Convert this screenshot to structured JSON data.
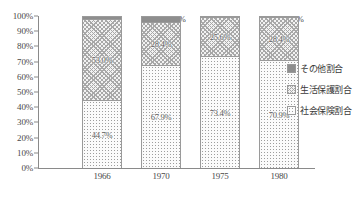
{
  "chart_data": {
    "type": "bar",
    "stacked": true,
    "normalized_percent": true,
    "title": "",
    "subtitle": "",
    "xlabel": "",
    "ylabel": "",
    "categories": [
      "1966",
      "1970",
      "1975",
      "1980"
    ],
    "ylim": [
      0,
      100
    ],
    "ytick_labels": [
      "100%",
      "90%",
      "80%",
      "70%",
      "60%",
      "50%",
      "40%",
      "30%",
      "20%",
      "10%",
      "0%"
    ],
    "ytick_values": [
      100,
      90,
      80,
      70,
      60,
      50,
      40,
      30,
      20,
      10,
      0
    ],
    "grid": false,
    "legend_position": "right",
    "series": [
      {
        "name": "その他割合",
        "key": "other",
        "pattern": "solid-gray",
        "color": "#8e8e8e",
        "values": [
          2.3,
          3.8,
          0.9,
          0.7
        ],
        "labels": [
          "2.3%",
          "3.8%",
          "0.9%",
          "0.7%"
        ],
        "label_placement": "outside-right"
      },
      {
        "name": "生活保護割合",
        "key": "welfare",
        "pattern": "crosshatch",
        "color": "#f2f2f2",
        "values": [
          53.0,
          28.4,
          25.6,
          28.4
        ],
        "labels": [
          "53.0%",
          "28.4%",
          "25.6%",
          "28.4%"
        ],
        "label_placement": "inside-center"
      },
      {
        "name": "社会保険割合",
        "key": "insurance",
        "pattern": "dotted",
        "color": "#fbfbfb",
        "values": [
          44.7,
          67.9,
          73.4,
          70.9
        ],
        "labels": [
          "44.7%",
          "67.9%",
          "73.4%",
          "70.9%"
        ],
        "label_placement": "inside-center"
      }
    ]
  },
  "legend": {
    "items": [
      {
        "label": "その他割合",
        "swatch": "solid-gray-swatch"
      },
      {
        "label": "生活保護割合",
        "swatch": "crosshatch-swatch"
      },
      {
        "label": "社会保険割合",
        "swatch": "dotted-swatch"
      }
    ]
  },
  "axes": {
    "y": {
      "ticks": [
        "100%",
        "90%",
        "80%",
        "70%",
        "60%",
        "50%",
        "40%",
        "30%",
        "20%",
        "10%",
        "0%"
      ]
    },
    "x": {
      "ticks": [
        "1966",
        "1970",
        "1975",
        "1980"
      ]
    }
  }
}
